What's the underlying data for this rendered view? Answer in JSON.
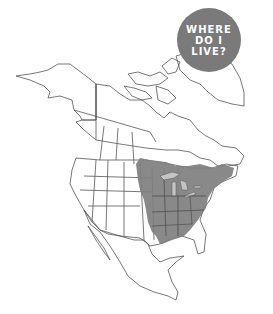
{
  "badge": {
    "lines": [
      "WHERE",
      "DO I",
      "LIVE?"
    ],
    "color": "#7a7a7a",
    "text_color": "#ffffff"
  },
  "map": {
    "region": "North America",
    "range_fill": "#7f7f7f",
    "outline_color": "#555555",
    "lakes_color": "#bdbdbd",
    "range_description": "Eastern United States and southeastern Canada"
  }
}
